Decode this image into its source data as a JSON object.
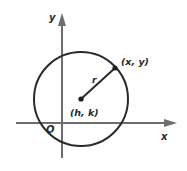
{
  "diagram": {
    "title": "",
    "type": "circle-on-coordinate-plane",
    "labels": {
      "y_axis": "y",
      "x_axis": "x",
      "origin": "O",
      "radius": "r",
      "point_on_circle": "(x, y)",
      "center": "(h, k)"
    },
    "colors": {
      "axis": "#6e6e6e",
      "circle": "#2a2a2a",
      "text": "#2a2a2a",
      "background": "#ffffff"
    }
  }
}
